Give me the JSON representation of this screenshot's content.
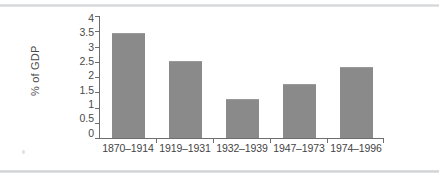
{
  "chart_data": {
    "type": "bar",
    "title": "",
    "subtitle": "",
    "xlabel": "",
    "ylabel": "% of GDP",
    "categories": [
      "1870–1914",
      "1919–1931",
      "1932–1939",
      "1947–1973",
      "1974–1996"
    ],
    "values": [
      3.4,
      2.5,
      1.25,
      1.75,
      2.3
    ],
    "series": [
      {
        "name": "% of GDP",
        "values": [
          3.4,
          2.5,
          1.25,
          1.75,
          2.3
        ]
      }
    ],
    "ylim": [
      0,
      4
    ],
    "ytick_labels": [
      "4",
      "3.5",
      "3",
      "2.5",
      "2",
      "1.5",
      "1",
      "0.5",
      "0"
    ],
    "ytick_values": [
      4,
      3.5,
      3,
      2.5,
      2,
      1.5,
      1,
      0.5,
      0
    ],
    "ytick_step": 0.5,
    "grid": false,
    "legend": false,
    "legend_position": "none",
    "bar_color": "#8a8a8a",
    "axis_color": "#6e6e6e",
    "text_color": "#444444",
    "background": "#ffffff"
  }
}
